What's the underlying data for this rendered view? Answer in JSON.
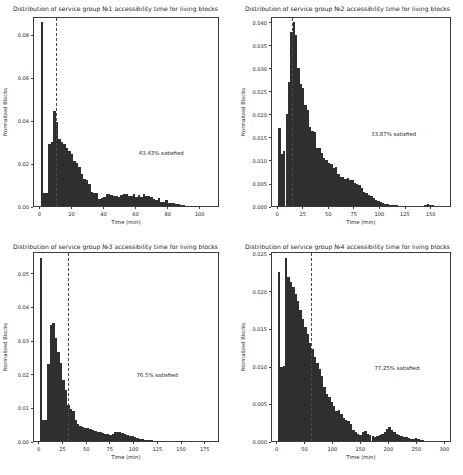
{
  "figure": {
    "width": 463,
    "height": 475,
    "background": "#ffffff",
    "bar_color": "#2f2f2f",
    "vline_color": "#4a4a4a",
    "axis_color": "#3b3b3b",
    "text_color": "#262626",
    "layout": "2x2 grid of histogram subplots"
  },
  "chart_data": [
    {
      "type": "bar",
      "id": "panel-1",
      "title": "Distribution of service group №1 accessibility time for living blocks",
      "xlabel": "Time (min)",
      "ylabel": "Normalized Blocks",
      "annotation": "43.43% satisfied",
      "annotation_x": 62,
      "annotation_y": 0.0245,
      "vline_x": 10,
      "xlim": [
        -4,
        112
      ],
      "ylim": [
        0,
        0.0885
      ],
      "xticks": [
        0,
        20,
        40,
        60,
        80,
        100
      ],
      "yticks": [
        0.0,
        0.02,
        0.04,
        0.06,
        0.08
      ],
      "ytick_labels": [
        "0.00",
        "0.02",
        "0.04",
        "0.06",
        "0.08"
      ],
      "grid": false,
      "legend": "none",
      "bin_width": 1.55,
      "bin_starts": [
        0.3,
        1.85,
        3.4,
        4.95,
        6.5,
        8.05,
        9.6,
        11.15,
        12.7,
        14.25,
        15.8,
        17.35,
        18.9,
        20.45,
        22.0,
        23.55,
        25.1,
        26.65,
        28.2,
        29.75,
        31.3,
        32.85,
        34.4,
        35.95,
        37.5,
        39.05,
        40.6,
        42.15,
        43.7,
        45.25,
        46.8,
        48.35,
        49.9,
        51.45,
        53.0,
        54.55,
        56.1,
        57.65,
        59.2,
        60.75,
        62.3,
        63.85,
        65.4,
        66.95,
        68.5,
        70.05,
        71.6,
        73.15,
        74.7,
        76.25,
        77.8,
        79.35,
        80.9,
        82.45,
        84.0,
        85.55,
        87.1,
        88.65,
        90.2,
        91.75,
        93.3,
        94.85,
        96.4,
        97.95,
        99.5,
        101.05,
        102.6,
        104.15,
        105.7,
        107.25
      ],
      "values": [
        0.0855,
        0.0062,
        0.0062,
        0.0287,
        0.0297,
        0.0443,
        0.039,
        0.0312,
        0.03,
        0.0287,
        0.0272,
        0.0258,
        0.0241,
        0.0209,
        0.0199,
        0.0182,
        0.0149,
        0.0124,
        0.012,
        0.0104,
        0.0066,
        0.0062,
        0.0062,
        0.0033,
        0.0037,
        0.0041,
        0.0058,
        0.0058,
        0.005,
        0.0045,
        0.0045,
        0.0041,
        0.005,
        0.0058,
        0.0058,
        0.0045,
        0.0045,
        0.0054,
        0.0041,
        0.005,
        0.0041,
        0.0058,
        0.0045,
        0.0045,
        0.0041,
        0.0033,
        0.0029,
        0.0037,
        0.002,
        0.002,
        0.0029,
        0.0016,
        0.0016,
        0.0012,
        0.0008,
        0.0008,
        0.0004,
        0.0004,
        0.0002,
        0.0002,
        0.0002,
        0.0001,
        0.0001,
        0.0,
        0.0,
        0.0,
        0.0,
        0.0,
        0.0,
        0.0
      ]
    },
    {
      "type": "bar",
      "id": "panel-2",
      "title": "Distribution of service group №2 accessibility time for living blocks",
      "xlabel": "Time (min)",
      "ylabel": "Normalized Blocks",
      "annotation": "33.87% satisfied",
      "annotation_x": 92,
      "annotation_y": 0.0157,
      "vline_x": 14,
      "xlim": [
        -6,
        170
      ],
      "ylim": [
        0,
        0.0412
      ],
      "xticks": [
        0,
        25,
        50,
        75,
        100,
        125,
        150
      ],
      "yticks": [
        0.0,
        0.005,
        0.01,
        0.015,
        0.02,
        0.025,
        0.03,
        0.035,
        0.04
      ],
      "ytick_labels": [
        "0.000",
        "0.005",
        "0.010",
        "0.015",
        "0.020",
        "0.025",
        "0.030",
        "0.035",
        "0.040"
      ],
      "grid": false,
      "legend": "none",
      "bin_width": 2.3,
      "bin_starts": [
        0.3,
        2.6,
        4.9,
        7.2,
        9.5,
        11.8,
        14.1,
        16.4,
        18.7,
        21.0,
        23.3,
        25.6,
        27.9,
        30.2,
        32.5,
        34.8,
        37.1,
        39.4,
        41.7,
        44.0,
        46.3,
        48.6,
        50.9,
        53.2,
        55.5,
        57.8,
        60.1,
        62.4,
        64.7,
        67.0,
        69.3,
        71.6,
        73.9,
        76.2,
        78.5,
        80.8,
        83.1,
        85.4,
        87.7,
        90.0,
        92.3,
        94.6,
        96.9,
        99.2,
        101.5,
        103.8,
        106.1,
        108.4,
        110.7,
        113.0,
        115.3,
        117.6,
        119.9,
        122.2,
        124.5,
        126.8,
        129.1,
        131.4,
        133.7,
        136.0,
        138.3,
        140.6,
        142.9,
        145.2,
        147.5,
        149.8,
        152.1,
        154.4,
        156.7,
        159.0
      ],
      "values": [
        0.017,
        0.0113,
        0.012,
        0.02,
        0.027,
        0.0378,
        0.0398,
        0.037,
        0.03,
        0.0264,
        0.0255,
        0.022,
        0.0208,
        0.0172,
        0.0162,
        0.016,
        0.0125,
        0.0126,
        0.0115,
        0.0105,
        0.01,
        0.0094,
        0.0092,
        0.0083,
        0.0085,
        0.007,
        0.0062,
        0.0063,
        0.0058,
        0.006,
        0.0056,
        0.0056,
        0.005,
        0.0048,
        0.0046,
        0.0038,
        0.003,
        0.0028,
        0.0024,
        0.0022,
        0.0018,
        0.0013,
        0.0011,
        0.0008,
        0.0006,
        0.0005,
        0.0004,
        0.0003,
        0.0003,
        0.0002,
        0.0002,
        0.0001,
        0.0001,
        0.0001,
        0.0,
        0.0,
        0.0,
        0.0,
        0.0,
        0.0,
        0.0,
        0.0,
        0.0003,
        0.0004,
        0.0003,
        0.0002,
        0.0,
        0.0,
        0.0,
        0.0
      ]
    },
    {
      "type": "bar",
      "id": "panel-3",
      "title": "Distribution of service group №3 accessibility time for living blocks",
      "xlabel": "Time (min)",
      "ylabel": "Normalized Blocks",
      "annotation": "76.5% satisfied",
      "annotation_x": 103,
      "annotation_y": 0.0196,
      "vline_x": 30,
      "xlim": [
        -6,
        190
      ],
      "ylim": [
        0,
        0.0565
      ],
      "xticks": [
        0,
        25,
        50,
        75,
        100,
        125,
        150,
        175
      ],
      "yticks": [
        0.0,
        0.01,
        0.02,
        0.03,
        0.04,
        0.05
      ],
      "ytick_labels": [
        "0.00",
        "0.01",
        "0.02",
        "0.03",
        "0.04",
        "0.05"
      ],
      "grid": false,
      "legend": "none",
      "bin_width": 2.6,
      "bin_starts": [
        0.3,
        2.9,
        5.5,
        8.1,
        10.7,
        13.3,
        15.9,
        18.5,
        21.1,
        23.7,
        26.3,
        28.9,
        31.5,
        34.1,
        36.7,
        39.3,
        41.9,
        44.5,
        47.1,
        49.7,
        52.3,
        54.9,
        57.5,
        60.1,
        62.7,
        65.3,
        67.9,
        70.5,
        73.1,
        75.7,
        78.3,
        80.9,
        83.5,
        86.1,
        88.7,
        91.3,
        93.9,
        96.5,
        99.1,
        101.7,
        104.3,
        106.9,
        109.5,
        112.1,
        114.7,
        117.3,
        119.9,
        122.5,
        125.1,
        127.7,
        130.3,
        132.9,
        135.5,
        138.1,
        140.7,
        143.3,
        145.9,
        148.5,
        151.1,
        153.7,
        156.3,
        158.9,
        161.5,
        164.1,
        166.7,
        169.3,
        171.9,
        174.5,
        177.1,
        179.7
      ],
      "values": [
        0.0545,
        0.0062,
        0.0062,
        0.0228,
        0.0345,
        0.035,
        0.0305,
        0.0265,
        0.0232,
        0.0182,
        0.0152,
        0.0108,
        0.0095,
        0.009,
        0.0062,
        0.005,
        0.0045,
        0.0042,
        0.004,
        0.0038,
        0.0035,
        0.0032,
        0.003,
        0.0028,
        0.0026,
        0.0024,
        0.0022,
        0.002,
        0.0019,
        0.0022,
        0.0026,
        0.0028,
        0.0026,
        0.0023,
        0.002,
        0.0018,
        0.0016,
        0.0014,
        0.0012,
        0.0009,
        0.0007,
        0.0005,
        0.0004,
        0.0003,
        0.0002,
        0.0002,
        0.0001,
        0.0001,
        0.0,
        0.0,
        0.0,
        0.0,
        0.0,
        0.0,
        0.0,
        0.0,
        0.0,
        0.0,
        0.0,
        0.0,
        0.0001,
        0.0001,
        0.0,
        0.0,
        0.0,
        0.0001,
        0.0,
        0.0,
        0.0,
        0.0
      ]
    },
    {
      "type": "bar",
      "id": "panel-4",
      "title": "Distribution of service group №4 accessibility time for living blocks",
      "xlabel": "Time (min)",
      "ylabel": "Normalized Blocks",
      "annotation": "77.25% satisfied",
      "annotation_x": 175,
      "annotation_y": 0.0097,
      "vline_x": 60,
      "xlim": [
        -10,
        312
      ],
      "ylim": [
        0,
        0.0253
      ],
      "xticks": [
        0,
        50,
        100,
        150,
        200,
        250,
        300
      ],
      "yticks": [
        0.0,
        0.005,
        0.01,
        0.015,
        0.02,
        0.025
      ],
      "ytick_labels": [
        "0.000",
        "0.005",
        "0.010",
        "0.015",
        "0.020",
        "0.025"
      ],
      "grid": false,
      "legend": "none",
      "bin_width": 4.3,
      "bin_starts": [
        0.3,
        4.6,
        8.9,
        13.2,
        17.5,
        21.8,
        26.1,
        30.4,
        34.7,
        39.0,
        43.3,
        47.6,
        51.9,
        56.2,
        60.5,
        64.8,
        69.1,
        73.4,
        77.7,
        82.0,
        86.3,
        90.6,
        94.9,
        99.2,
        103.5,
        107.8,
        112.1,
        116.4,
        120.7,
        125.0,
        129.3,
        133.6,
        137.9,
        142.2,
        146.5,
        150.8,
        155.1,
        159.4,
        163.7,
        168.0,
        172.3,
        176.6,
        180.9,
        185.2,
        189.5,
        193.8,
        198.1,
        202.4,
        206.7,
        211.0,
        215.3,
        219.6,
        223.9,
        228.2,
        232.5,
        236.8,
        241.1,
        245.4,
        249.7,
        254.0,
        258.3,
        262.6,
        266.9,
        271.2,
        275.5,
        279.8,
        284.1,
        288.4,
        292.7,
        297.0
      ],
      "values": [
        0.0225,
        0.0098,
        0.01,
        0.0244,
        0.0218,
        0.0212,
        0.0205,
        0.0196,
        0.0186,
        0.0174,
        0.0162,
        0.0152,
        0.0142,
        0.013,
        0.0122,
        0.0112,
        0.0104,
        0.0096,
        0.0086,
        0.0072,
        0.0062,
        0.0058,
        0.0052,
        0.0046,
        0.004,
        0.0041,
        0.0036,
        0.003,
        0.0028,
        0.0026,
        0.0022,
        0.0015,
        0.0012,
        0.001,
        0.0008,
        0.0012,
        0.0014,
        0.001,
        0.0008,
        0.0007,
        0.0006,
        0.0007,
        0.0008,
        0.0009,
        0.0012,
        0.0016,
        0.0018,
        0.0015,
        0.0012,
        0.001,
        0.0008,
        0.0007,
        0.0006,
        0.0005,
        0.0004,
        0.0003,
        0.0003,
        0.0004,
        0.0003,
        0.0002,
        0.0001,
        0.0,
        0.0,
        0.0,
        0.0,
        0.0,
        0.0,
        0.0,
        0.0,
        0.0
      ]
    }
  ]
}
